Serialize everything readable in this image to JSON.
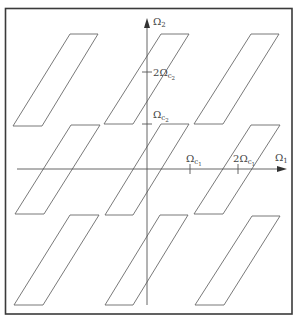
{
  "diagram": {
    "title": "",
    "axes": {
      "horizontal": {
        "label_main": "Ω",
        "label_sub": "1",
        "ticks": [
          {
            "id": "omega-c1",
            "prefix": "",
            "main": "Ω",
            "sub": "c",
            "subsub": "1",
            "x": 190
          },
          {
            "id": "two-omega-c1",
            "prefix": "2",
            "main": "Ω",
            "sub": "c",
            "subsub": "1",
            "x": 238
          }
        ]
      },
      "vertical": {
        "label_main": "Ω",
        "label_sub": "2",
        "ticks": [
          {
            "id": "omega-c2",
            "prefix": "",
            "main": "Ω",
            "sub": "c",
            "subsub": "2",
            "y": 124
          },
          {
            "id": "two-omega-c2",
            "prefix": "2",
            "main": "Ω",
            "sub": "c",
            "subsub": "2",
            "y": 72
          }
        ]
      }
    },
    "regions": [
      {
        "id": "top-left",
        "row": 1,
        "col": -1,
        "points": "70,34 98,34 42,126 13,126"
      },
      {
        "id": "top-center",
        "row": 1,
        "col": 0,
        "points": "161,34 189,34 133,124 104,124"
      },
      {
        "id": "top-right",
        "row": 1,
        "col": 1,
        "points": "251,34 279,34 223,124 194,124"
      },
      {
        "id": "middle-left",
        "row": 0,
        "col": -1,
        "points": "71,125 100,125 44,214 15,214"
      },
      {
        "id": "middle-center",
        "row": 0,
        "col": 0,
        "points": "161,124 189,124 133,215 105,215"
      },
      {
        "id": "middle-right",
        "row": 0,
        "col": 1,
        "points": "251,125 280,125 223,214 194,214"
      },
      {
        "id": "bottom-left",
        "row": -1,
        "col": -1,
        "points": "70,215 99,215 43,305 14,305"
      },
      {
        "id": "bottom-center",
        "row": -1,
        "col": 0,
        "points": "160,215 188,215 133,305 105,305"
      },
      {
        "id": "bottom-right",
        "row": -1,
        "col": 1,
        "points": "252,216 280,216 224,305 195,305"
      }
    ]
  }
}
